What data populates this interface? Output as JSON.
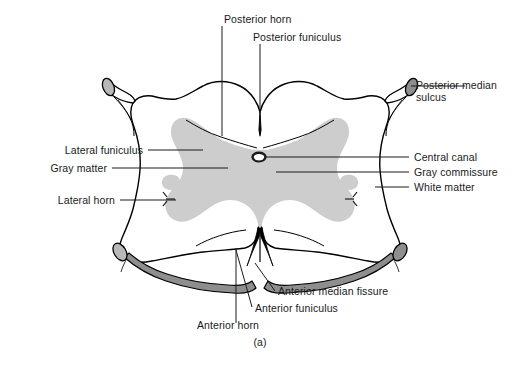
{
  "figure": {
    "caption": "(a)",
    "colors": {
      "gray_matter": "#cdcdcd",
      "white_matter": "#ffffff",
      "root_fill": "#8e8e8e",
      "root_fill_light": "#b8b8b8",
      "outline": "#000000",
      "text": "#1a1a1a",
      "leader_line": "#1a1a1a",
      "background": "#ffffff"
    }
  },
  "labels": {
    "posterior_horn": "Posterior horn",
    "posterior_funiculus": "Posterior funiculus",
    "posterior_median_sulcus_line1": "Posterior median",
    "posterior_median_sulcus_line2": "sulcus",
    "lateral_funiculus": "Lateral funiculus",
    "gray_matter": "Gray matter",
    "lateral_horn": "Lateral horn",
    "central_canal": "Central canal",
    "gray_commissure": "Gray commissure",
    "white_matter": "White matter",
    "anterior_median_fissure": "Anterior median fissure",
    "anterior_funiculus": "Anterior funiculus",
    "anterior_horn": "Anterior horn"
  },
  "structures": {
    "gray_matter_name": "gray-matter-butterfly",
    "white_matter_name": "white-matter-region",
    "central_canal_name": "central-canal",
    "posterior_median_sulcus_name": "posterior-median-sulcus",
    "anterior_median_fissure_name": "anterior-median-fissure",
    "dorsal_root_left_name": "dorsal-root-left",
    "dorsal_root_right_name": "dorsal-root-right",
    "ventral_root_left_name": "ventral-root-left",
    "ventral_root_right_name": "ventral-root-right"
  }
}
